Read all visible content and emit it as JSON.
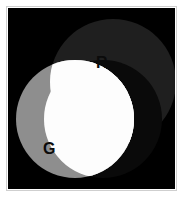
{
  "figure": {
    "kind": "additive-color-venn-diagram",
    "background_color": "#ffffff",
    "canvas_color": "#000000",
    "border_color": "#cfcfcf"
  },
  "chart_data": {
    "type": "venn",
    "xlabel": "",
    "ylabel": "",
    "sets": [
      {
        "id": "R",
        "label": "R",
        "name": "red-channel",
        "fill": "#1f1f1f",
        "cx": 105,
        "cy": 74,
        "r": 63,
        "label_x": 88,
        "label_y": 47
      },
      {
        "id": "G",
        "label": "G",
        "name": "green-channel",
        "fill": "#8e8e8e",
        "cx": 67,
        "cy": 111,
        "r": 59,
        "label_x": 35,
        "label_y": 133
      },
      {
        "id": "B",
        "label": "",
        "name": "blue-channel",
        "fill": "#0a0a0a",
        "cx": 95,
        "cy": 111,
        "r": 59,
        "label_x": null,
        "label_y": null
      }
    ],
    "intersections": [
      {
        "sets": [
          "R",
          "G"
        ],
        "fill": "#a8a8a8",
        "name": "yellow-region"
      },
      {
        "sets": [
          "G",
          "B"
        ],
        "fill": "#9a9a9a",
        "name": "cyan-region"
      },
      {
        "sets": [
          "R",
          "G",
          "B"
        ],
        "fill": "#fdfdfd",
        "name": "white-region"
      }
    ],
    "legend": {
      "show": false,
      "position": "none"
    },
    "grid": false
  },
  "labels": {
    "r": "R",
    "g": "G"
  }
}
